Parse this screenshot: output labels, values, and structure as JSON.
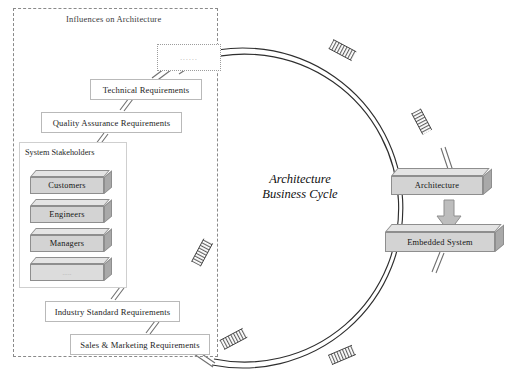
{
  "diagram": {
    "center_caption_line1": "Architecture",
    "center_caption_line2": "Business  Cycle",
    "influences_panel_title": "Influences on Architecture",
    "stakeholders_title": "System Stakeholders"
  },
  "influences": {
    "items": [
      {
        "label": "......",
        "kind": "dotted"
      },
      {
        "label": "Technical Requirements",
        "kind": "flat"
      },
      {
        "label": "Quality Assurance Requirements",
        "kind": "flat"
      },
      {
        "label": "Industry Standard Requirements",
        "kind": "flat"
      },
      {
        "label": "Sales & Marketing Requirements",
        "kind": "flat"
      }
    ]
  },
  "stakeholders": {
    "items": [
      {
        "label": "Customers"
      },
      {
        "label": "Engineers"
      },
      {
        "label": "Managers"
      },
      {
        "label": "....."
      }
    ]
  },
  "outputs": {
    "architecture_label": "Architecture",
    "embedded_system_label": "Embedded System"
  },
  "colors": {
    "box_face": "#d3d3d3",
    "box_top": "#e4e4e4",
    "box_side": "#a9a9a9",
    "outline": "#8e8e8e",
    "flat_border": "#b9b9b9",
    "dashed_border": "#8a8a8a",
    "arc_stroke": "#2e2e2e",
    "arrow_fill": "#bdbdbd"
  }
}
